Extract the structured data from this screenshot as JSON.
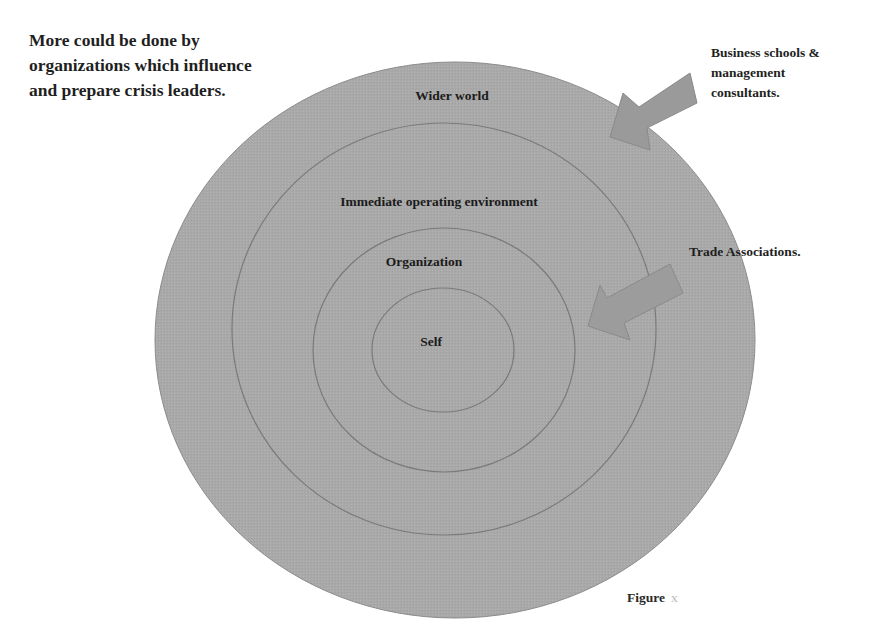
{
  "headline": {
    "lines": [
      "More could be done by",
      "organizations which influence",
      "and prepare crisis leaders."
    ]
  },
  "diagram": {
    "type": "concentric-circles",
    "fill_color": "#a9a9a9",
    "stroke_color": "#7a7a7a",
    "rings": [
      {
        "label": "Wider world",
        "cx": 455,
        "cy": 340,
        "rx": 300,
        "ry": 278,
        "label_x": 452,
        "label_y": 95
      },
      {
        "label": "Immediate operating environment",
        "cx": 444,
        "cy": 329,
        "rx": 212,
        "ry": 206,
        "label_x": 439,
        "label_y": 201
      },
      {
        "label": "Organization",
        "cx": 444,
        "cy": 350,
        "rx": 131,
        "ry": 122,
        "label_x": 424,
        "label_y": 261
      },
      {
        "label": "Self",
        "cx": 443,
        "cy": 350,
        "rx": 71,
        "ry": 62,
        "label_x": 431,
        "label_y": 341
      }
    ]
  },
  "callouts": [
    {
      "name": "business-schools",
      "lines": [
        "Business schools &",
        "management",
        "consultants."
      ],
      "arrow_color": "#9a9a9a",
      "arrow_points": "690,73 697,103 647,128 650,150 610,137 623,93 639,107"
    },
    {
      "name": "trade-associations",
      "lines": [
        "Trade Associations."
      ],
      "arrow_color": "#9c9c9c",
      "arrow_points": "670,264 683,293 624,323 630,340 588,326 600,285 607,298"
    }
  ],
  "figure_caption": {
    "label": "Figure",
    "number": "x"
  }
}
